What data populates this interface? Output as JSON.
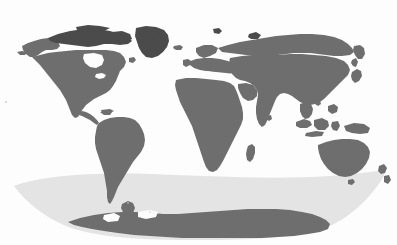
{
  "figure": {
    "kind": "world-map",
    "title": "World Map",
    "projection": "robinson",
    "width": 397,
    "height": 245,
    "background_color": "#fdfdfd",
    "has_labels": false,
    "has_gridlines": false,
    "has_legend": false,
    "has_borders": false,
    "has_axes": false
  },
  "colors": {
    "background": "#fdfdfd",
    "land": "#6e6e6e",
    "land_dark": "#4b4b4b",
    "ocean": "#fdfdfd",
    "southern_ocean_band": "#e4e4e4",
    "antarctica": "#6e6e6e"
  },
  "layers": [
    {
      "id": "ocean-background",
      "name": "ocean",
      "color": "#fdfdfd",
      "description": "White ocean / page background"
    },
    {
      "id": "southern-ocean-band",
      "name": "southern-ocean-highlight",
      "color": "#e4e4e4",
      "description": "Light gray lens-shaped band across the Southern Ocean"
    },
    {
      "id": "landmasses",
      "name": "land",
      "color": "#6e6e6e",
      "description": "Dark gray continental landmasses"
    }
  ],
  "regions": [
    {
      "id": "north-america",
      "label": "North America",
      "color": "#6e6e6e"
    },
    {
      "id": "greenland",
      "label": "Greenland",
      "color": "#4b4b4b"
    },
    {
      "id": "south-america",
      "label": "South America",
      "color": "#6e6e6e"
    },
    {
      "id": "africa",
      "label": "Africa",
      "color": "#6e6e6e"
    },
    {
      "id": "europe",
      "label": "Europe",
      "color": "#6e6e6e"
    },
    {
      "id": "asia",
      "label": "Asia",
      "color": "#6e6e6e"
    },
    {
      "id": "australia",
      "label": "Australia",
      "color": "#6e6e6e"
    },
    {
      "id": "antarctica",
      "label": "Antarctica",
      "color": "#6e6e6e"
    },
    {
      "id": "madagascar",
      "label": "Madagascar",
      "color": "#6e6e6e"
    },
    {
      "id": "new-zealand",
      "label": "New Zealand",
      "color": "#6e6e6e"
    },
    {
      "id": "japan",
      "label": "Japan",
      "color": "#6e6e6e"
    },
    {
      "id": "indonesia",
      "label": "Indonesia",
      "color": "#6e6e6e"
    },
    {
      "id": "british-isles",
      "label": "British Isles",
      "color": "#6e6e6e"
    },
    {
      "id": "iceland",
      "label": "Iceland",
      "color": "#6e6e6e"
    }
  ]
}
